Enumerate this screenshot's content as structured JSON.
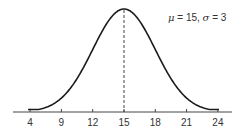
{
  "chart_data": {
    "type": "line",
    "title": "",
    "xlabel": "",
    "ylabel": "",
    "distribution": "normal",
    "mean": 15,
    "std_dev": 3,
    "annotation": "μ = 15, σ = 3",
    "annotation_parts": {
      "mu_symbol": "μ",
      "mu_text": " = 15, ",
      "sigma_symbol": "σ",
      "sigma_text": " = 3"
    },
    "x_tick_labels": [
      "4",
      "9",
      "12",
      "15",
      "18",
      "21",
      "24"
    ],
    "x_tick_values_nominal": [
      6,
      9,
      12,
      15,
      18,
      21,
      24
    ],
    "xlim": [
      4.5,
      25.5
    ],
    "mean_line": {
      "x": 15,
      "style": "dashed"
    },
    "y_axis_shown": false,
    "grid": false,
    "legend": null,
    "curve_color": "#1a1a1a",
    "axis_color": "#444444"
  }
}
